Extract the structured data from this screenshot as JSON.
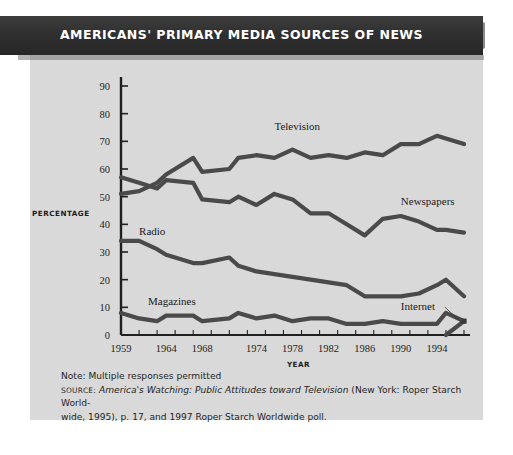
{
  "banner": {
    "title": "AMERICANS' PRIMARY MEDIA SOURCES OF NEWS"
  },
  "notes": {
    "note": "Note: Multiple responses permitted",
    "source_kicker": "SOURCE:",
    "source_title": "America's Watching: Public Attitudes toward Television",
    "source_rest": " (New York: Roper Starch World-",
    "source_line2": "wide, 1995), p. 17, and 1997 Roper Starch Worldwide poll."
  },
  "chart_data": {
    "type": "line",
    "title": "AMERICANS' PRIMARY MEDIA SOURCES OF NEWS",
    "xlabel": "YEAR",
    "ylabel": "PERCENTAGE",
    "xlim": [
      1959,
      1997
    ],
    "ylim": [
      0,
      90
    ],
    "y_ticks": [
      0,
      10,
      20,
      30,
      40,
      50,
      60,
      70,
      80,
      90
    ],
    "x_tick_labels": [
      "1959",
      "1964",
      "1968",
      "1974",
      "1978",
      "1982",
      "1986",
      "1990",
      "1994"
    ],
    "x_tick_label_values": [
      1959,
      1964,
      1968,
      1974,
      1978,
      1982,
      1986,
      1990,
      1994
    ],
    "grid": false,
    "legend": "inline-labels",
    "annotations": [
      {
        "text": "Television",
        "x": 1976,
        "y": 74
      },
      {
        "text": "Newspapers",
        "x": 1990,
        "y": 47
      },
      {
        "text": "Radio",
        "x": 1961,
        "y": 36
      },
      {
        "text": "Magazines",
        "x": 1962,
        "y": 11
      },
      {
        "text": "Internet",
        "x": 1990,
        "y": 9,
        "leader_to": {
          "x": 1997,
          "y": 4
        }
      }
    ],
    "series": [
      {
        "name": "Television",
        "x": [
          1959,
          1961,
          1963,
          1964,
          1967,
          1968,
          1971,
          1972,
          1974,
          1976,
          1978,
          1980,
          1982,
          1984,
          1986,
          1988,
          1990,
          1992,
          1994,
          1995,
          1997
        ],
        "values": [
          51,
          52,
          55,
          58,
          64,
          59,
          60,
          64,
          65,
          64,
          67,
          64,
          65,
          64,
          66,
          65,
          69,
          69,
          72,
          71,
          69
        ]
      },
      {
        "name": "Newspapers",
        "x": [
          1959,
          1961,
          1963,
          1964,
          1967,
          1968,
          1971,
          1972,
          1974,
          1976,
          1978,
          1980,
          1982,
          1984,
          1986,
          1988,
          1990,
          1992,
          1994,
          1995,
          1997
        ],
        "values": [
          57,
          55,
          53,
          56,
          55,
          49,
          48,
          50,
          47,
          51,
          49,
          44,
          44,
          40,
          36,
          42,
          43,
          41,
          38,
          38,
          37
        ]
      },
      {
        "name": "Radio",
        "x": [
          1959,
          1961,
          1963,
          1964,
          1967,
          1968,
          1971,
          1972,
          1974,
          1976,
          1978,
          1980,
          1982,
          1984,
          1986,
          1988,
          1990,
          1992,
          1994,
          1995,
          1997
        ],
        "values": [
          34,
          34,
          31,
          29,
          26,
          26,
          28,
          25,
          23,
          22,
          21,
          20,
          19,
          18,
          14,
          14,
          14,
          15,
          18,
          20,
          14
        ]
      },
      {
        "name": "Magazines",
        "x": [
          1959,
          1961,
          1963,
          1964,
          1967,
          1968,
          1971,
          1972,
          1974,
          1976,
          1978,
          1980,
          1982,
          1984,
          1986,
          1988,
          1990,
          1992,
          1994,
          1995,
          1997
        ],
        "values": [
          8,
          6,
          5,
          7,
          7,
          5,
          6,
          8,
          6,
          7,
          5,
          6,
          6,
          4,
          4,
          5,
          4,
          4,
          4,
          8,
          5
        ]
      },
      {
        "name": "Internet",
        "x": [
          1995,
          1997
        ],
        "values": [
          0,
          5
        ]
      }
    ]
  }
}
